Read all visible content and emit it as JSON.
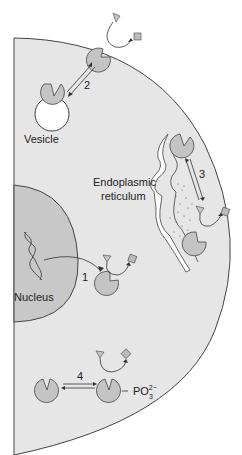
{
  "diagram": {
    "labels": {
      "vesicle": "Vesicle",
      "er_line1": "Endoplasmic",
      "er_line2": "reticulum",
      "nucleus": "Nucleus",
      "phosphate": "PO",
      "phosphate_sub": "3",
      "phosphate_sup": "2−"
    },
    "steps": {
      "s1": "1",
      "s2": "2",
      "s3": "3",
      "s4": "4"
    },
    "colors": {
      "cytoplasm": "#e6e6e6",
      "nucleus": "#c8c8c8",
      "enzyme": "#c4c4c4",
      "outline": "#444444",
      "background": "#ffffff"
    }
  }
}
